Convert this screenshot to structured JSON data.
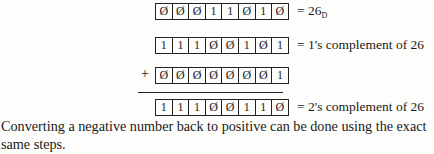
{
  "rows": [
    {
      "bits": [
        "Ø",
        "Ø",
        "Ø",
        "1",
        "1",
        "Ø",
        "1",
        "Ø"
      ],
      "label": "= 26",
      "label_sub": "D"
    },
    {
      "bits": [
        "1",
        "1",
        "1",
        "Ø",
        "Ø",
        "1",
        "Ø",
        "1"
      ],
      "label": "= 1's complement of 26"
    },
    {
      "bits": [
        "Ø",
        "Ø",
        "Ø",
        "Ø",
        "Ø",
        "Ø",
        "Ø",
        "1"
      ],
      "operator": "+"
    },
    {
      "bits": [
        "1",
        "1",
        "1",
        "Ø",
        "Ø",
        "1",
        "1",
        "Ø"
      ],
      "label": "= 2's complement of 26"
    }
  ],
  "paragraph": "Converting a negative number back to positive can be done using the exact same steps."
}
